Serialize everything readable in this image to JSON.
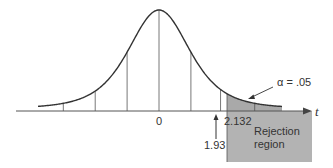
{
  "chart_data": {
    "type": "area",
    "title": "",
    "distribution": "Student t",
    "df": 4,
    "xlabel": "t",
    "ylabel": "",
    "xlim": [
      -5.2,
      5.6
    ],
    "grid": false,
    "legend": null,
    "tick_labels": [
      {
        "x": 0,
        "label": "0"
      },
      {
        "x": 2.132,
        "label": "2.132"
      }
    ],
    "vertical_lines_x": [
      -3,
      -2,
      -1,
      0,
      1,
      1.93,
      3
    ],
    "critical_value": 2.132,
    "test_statistic": 1.93,
    "alpha": 0.05,
    "shaded_region": {
      "from": 2.132,
      "to": 4.0,
      "area": 0.05
    },
    "annotations": [
      {
        "text": "α = .05",
        "points_to": "shaded tail area"
      },
      {
        "text": "1.93",
        "points_to": "observed test statistic",
        "arrow": "up"
      },
      {
        "text": "Rejection region",
        "box_from_x": 2.132
      }
    ]
  },
  "labels": {
    "zero": "0",
    "critical": "2.132",
    "observed": "1.93",
    "alpha": "α = .05",
    "axis": "t",
    "rejection_line1": "Rejection",
    "rejection_line2": "region"
  },
  "colors": {
    "curve": "#333333",
    "axis": "#555555",
    "shade": "#a9a9a9",
    "box": "#b3b3b3",
    "text": "#333333"
  }
}
